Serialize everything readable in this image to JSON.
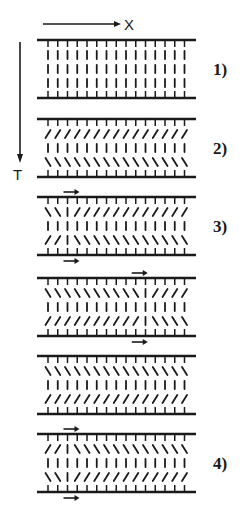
{
  "axes": {
    "x_label": "X",
    "t_label": "T"
  },
  "colors": {
    "ink": "#1a1a1a",
    "background": "#ffffff"
  },
  "molecule_columns": 15,
  "legend": {
    "orientation_codes": {
      "/": "tilted right",
      "|": "vertical",
      "\\": "tilted left"
    }
  },
  "panels": [
    {
      "label": "1)",
      "rows": [
        "|||||||||||||||",
        "|||||||||||||||",
        "|||||||||||||||"
      ],
      "flow_arrows": []
    },
    {
      "label": "2)",
      "rows": [
        "///////////////",
        "|||||||||||||||",
        "\\\\\\\\\\\\\\\\\\\\\\\\\\\\\\"
      ],
      "flow_arrows": []
    },
    {
      "label": "3)",
      "rows": [
        "\\\\|////////////",
        "|||||||||||||||",
        "//|\\\\\\\\\\\\\\\\\\\\\\\\\\\\"
      ],
      "flow_arrows": [
        {
          "plate": "top",
          "column": 3
        },
        {
          "plate": "bottom",
          "column": 3
        }
      ]
    },
    {
      "label": "",
      "rows": [
        "\\\\\\\\\\\\\\\\\\\\|////",
        "|||||||||||||||",
        "//////////|\\\\\\\\\\\\\\\\"
      ],
      "flow_arrows": [
        {
          "plate": "top",
          "column": 10
        },
        {
          "plate": "bottom",
          "column": 10
        }
      ]
    },
    {
      "label": "",
      "rows": [
        "\\\\\\\\\\\\\\\\\\\\\\\\\\\\\\",
        "|||||||||||||||",
        "///////////////"
      ],
      "flow_arrows": []
    },
    {
      "label": "4)",
      "rows": [
        "//|\\\\\\\\\\\\\\\\\\\\\\\\\\\\",
        "|||||||||||||||",
        "\\\\|////////////"
      ],
      "flow_arrows": [
        {
          "plate": "top",
          "column": 3
        },
        {
          "plate": "bottom",
          "column": 3
        }
      ]
    }
  ]
}
